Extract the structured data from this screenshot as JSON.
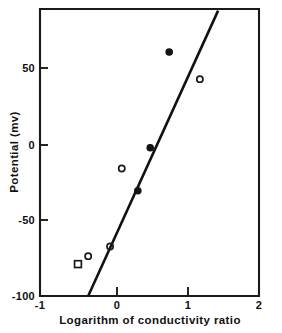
{
  "chart_data": {
    "type": "scatter",
    "title": "",
    "xlabel": "Logarithm of conductivity ratio",
    "ylabel": "Potential (mv)",
    "xlim": [
      -1,
      2
    ],
    "ylim": [
      -100,
      80
    ],
    "xticks": [
      -1,
      0,
      1,
      2
    ],
    "xticklabels": [
      "-1",
      "0",
      "1",
      "2"
    ],
    "yticks": [
      50,
      0,
      -50,
      -100
    ],
    "yticklabels": [
      "50",
      "0",
      "-50",
      "-100"
    ],
    "grid": false,
    "legend": false,
    "legend_position": "none",
    "series": [
      {
        "name": "open-circle",
        "marker": "open circle",
        "points": [
          {
            "x": -0.34,
            "y": -75
          },
          {
            "x": -0.04,
            "y": -69
          },
          {
            "x": 0.12,
            "y": -20
          },
          {
            "x": 1.19,
            "y": 36
          }
        ]
      },
      {
        "name": "filled-circle",
        "marker": "filled circle",
        "points": [
          {
            "x": 0.34,
            "y": -34
          },
          {
            "x": 0.51,
            "y": -7
          },
          {
            "x": 0.77,
            "y": 53
          }
        ]
      },
      {
        "name": "open-square",
        "marker": "open square",
        "points": [
          {
            "x": -0.48,
            "y": -80
          }
        ]
      }
    ],
    "fit_line": {
      "name": "regression-line",
      "x0": -0.34,
      "y0": -100,
      "x1": 1.44,
      "y1": 79
    }
  },
  "caption": {
    "text": ""
  }
}
